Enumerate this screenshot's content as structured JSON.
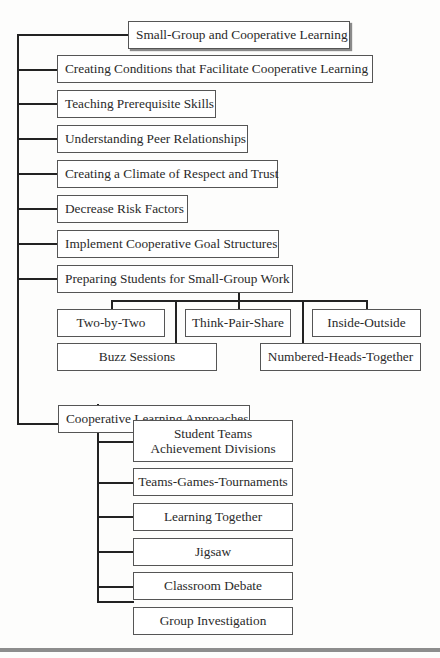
{
  "diagram": {
    "root": {
      "label": "Small-Group and Cooperative Learning"
    },
    "level1": [
      {
        "label": "Creating Conditions that Facilitate Cooperative Learning"
      },
      {
        "label": "Teaching Prerequisite Skills"
      },
      {
        "label": "Understanding Peer Relationships"
      },
      {
        "label": "Creating a Climate of Respect and Trust"
      },
      {
        "label": "Decrease Risk Factors"
      },
      {
        "label": "Implement Cooperative Goal Structures"
      },
      {
        "label": "Preparing Students for Small-Group Work"
      },
      {
        "label": "Cooperative Learning Approaches"
      }
    ],
    "small_group_strategies": [
      {
        "label": "Two-by-Two"
      },
      {
        "label": "Think-Pair-Share"
      },
      {
        "label": "Inside-Outside"
      },
      {
        "label": "Buzz Sessions"
      },
      {
        "label": "Numbered-Heads-Together"
      }
    ],
    "approaches": [
      {
        "label": "Student Teams Achievement Divisions"
      },
      {
        "label": "Teams-Games-Tournaments"
      },
      {
        "label": "Learning Together"
      },
      {
        "label": "Jigsaw"
      },
      {
        "label": "Classroom Debate"
      },
      {
        "label": "Group Investigation"
      }
    ]
  }
}
